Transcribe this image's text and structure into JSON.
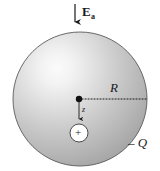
{
  "figure": {
    "background_color": "#ffffff",
    "labels": {
      "applied_field": "E",
      "applied_field_subscript": "a",
      "radius": "R",
      "offset": "z",
      "sphere_charge": "– Q",
      "point_charge": "+"
    },
    "colors": {
      "sphere_fill_light": "#f4f4f4",
      "sphere_fill_mid": "#cccccc",
      "sphere_fill_dark": "#a8a8a8",
      "outline": "#4d4d4d",
      "ink": "#1a1a1a",
      "point_charge_fill": "#ffffff"
    },
    "geometry": {
      "sphere_center_x": 80,
      "sphere_center_y": 99,
      "sphere_radius": 67,
      "center_dot_x": 79,
      "center_dot_y": 99,
      "point_charge_x": 79,
      "point_charge_y": 133,
      "point_charge_radius": 9,
      "radius_line_end_x": 147,
      "field_arrow_x": 75,
      "field_arrow_top_y": 4,
      "field_arrow_bottom_y": 28
    }
  }
}
